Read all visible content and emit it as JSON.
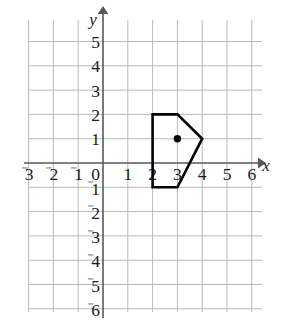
{
  "chart_data": {
    "type": "scatter",
    "title": "",
    "xlabel": "x",
    "ylabel": "y",
    "xlim": [
      -3.4,
      6.6
    ],
    "ylim": [
      -6.4,
      5.6
    ],
    "grid": true,
    "grid_spacing": 1,
    "legend": null,
    "x_ticks": [
      -3,
      -2,
      -1,
      0,
      1,
      2,
      3,
      4,
      5,
      6
    ],
    "y_ticks": [
      5,
      4,
      3,
      2,
      1,
      0,
      -1,
      -2,
      -3,
      -4,
      -5,
      -6
    ],
    "x_tick_labels": [
      "⁻3",
      "⁻2",
      "⁻1",
      "0",
      "1",
      "2",
      "3",
      "4",
      "5",
      "6"
    ],
    "y_tick_labels": [
      "5",
      "4",
      "3",
      "2",
      "1",
      "0",
      "⁻1",
      "⁻2",
      "⁻3",
      "⁻4",
      "⁻5",
      "⁻6"
    ],
    "annotations": [
      {
        "name": "pentagon",
        "kind": "polygon",
        "closed": true,
        "vertices": [
          [
            2,
            2
          ],
          [
            3,
            2
          ],
          [
            4,
            1
          ],
          [
            3,
            -1
          ],
          [
            2,
            -1
          ]
        ],
        "stroke": "#000000",
        "fill": "none"
      },
      {
        "name": "center-point",
        "kind": "point",
        "x": 3,
        "y": 1,
        "color": "#000000"
      }
    ],
    "series": [
      {
        "name": "center-point",
        "x": [
          3
        ],
        "y": [
          1
        ]
      }
    ]
  },
  "axes": {
    "x_axis_name": "x",
    "y_axis_name": "y",
    "origin_label": "0"
  },
  "ticks": {
    "x_positive": [
      "1",
      "2",
      "3",
      "4",
      "5",
      "6"
    ],
    "x_negative": [
      "3",
      "2",
      "1"
    ],
    "y_positive": [
      "5",
      "4",
      "3",
      "2",
      "1"
    ],
    "y_negative": [
      "1",
      "2",
      "3",
      "4",
      "5",
      "6"
    ],
    "minus_glyph": "⁻"
  },
  "colors": {
    "grid": "#b9b9bd",
    "axis": "#58585c",
    "shape_stroke": "#000000",
    "label": "#1a1a1a",
    "background": "#ffffff"
  }
}
